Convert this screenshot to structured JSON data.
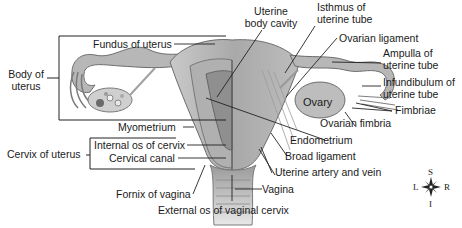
{
  "diagram": {
    "type": "anatomical-illustration",
    "labels": {
      "fundus": "Fundus of uterus",
      "body_cavity_1": "Uterine",
      "body_cavity_2": "body cavity",
      "isthmus_1": "Isthmus of",
      "isthmus_2": "uterine tube",
      "ovarian_ligament": "Ovarian ligament",
      "ampulla_1": "Ampulla of",
      "ampulla_2": "uterine tube",
      "infundibulum_1": "Infundibulum of",
      "infundibulum_2": "uterine tube",
      "fimbriae": "Fimbriae",
      "ovary": "Ovary",
      "ovarian_fimbria": "Ovarian fimbria",
      "body_of_uterus_1": "Body of",
      "body_of_uterus_2": "uterus",
      "myometrium": "Myometrium",
      "endometrium": "Endometrium",
      "broad_ligament": "Broad ligament",
      "uterine_artery_vein": "Uterine artery and vein",
      "cervix_of_uterus": "Cervix of uterus",
      "internal_os": "Internal os of cervix",
      "cervical_canal": "Cervical canal",
      "fornix": "Fornix of vagina",
      "vagina": "Vagina",
      "external_os": "External os of vaginal cervix"
    },
    "compass": {
      "superior": "S",
      "inferior": "I",
      "left": "L",
      "right": "R"
    }
  }
}
